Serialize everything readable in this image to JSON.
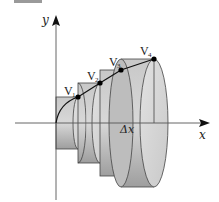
{
  "figure": {
    "axes": {
      "x_label": "x",
      "y_label": "y"
    },
    "delta_label": "Δx",
    "points": [
      {
        "name": "V1",
        "label": "V",
        "sub": "1"
      },
      {
        "name": "V2",
        "label": "V",
        "sub": "2"
      },
      {
        "name": "V3",
        "label": "V",
        "sub": "3"
      },
      {
        "name": "V4",
        "label": "V",
        "sub": "4"
      }
    ],
    "disk_count": 4,
    "colors": {
      "disk_light": "#d9d9d9",
      "disk_mid": "#bdbdbd",
      "disk_dark": "#9a9a9a",
      "outline": "#444444",
      "axis": "#555555",
      "point": "#000000"
    }
  }
}
